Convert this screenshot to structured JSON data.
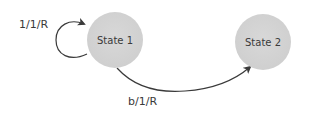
{
  "diagram": {
    "type": "state-machine",
    "states": [
      {
        "id": "s1",
        "label": "State 1"
      },
      {
        "id": "s2",
        "label": "State 2"
      }
    ],
    "transitions": [
      {
        "from": "s1",
        "to": "s1",
        "label": "1/1/R"
      },
      {
        "from": "s1",
        "to": "s2",
        "label": "b/1/R"
      }
    ]
  },
  "colors": {
    "state_fill": "#d4d4d4",
    "edge": "#3a3a3a",
    "text": "#3a3a3a"
  }
}
